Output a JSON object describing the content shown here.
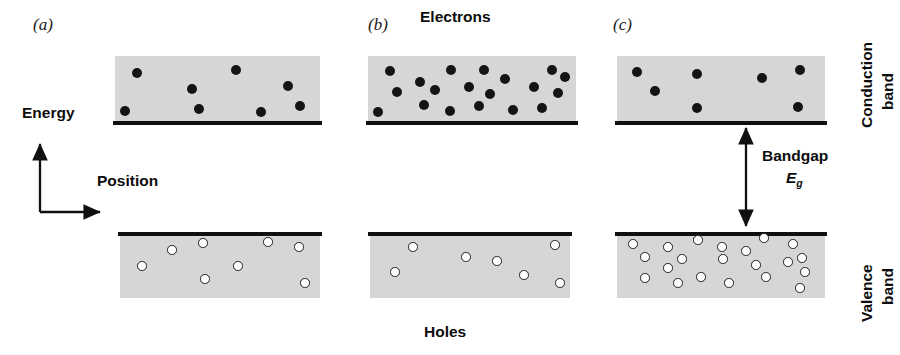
{
  "figure": {
    "background_color": "#ffffff",
    "band_fill_color": "#d6d6d6",
    "band_edge_color": "#101010",
    "electron_color": "#141414",
    "hole_fill_color": "#ffffff",
    "hole_stroke_color": "#1d1d1d"
  },
  "axes": {
    "energy_label": "Energy",
    "position_label": "Position"
  },
  "annotations": {
    "electrons_label": "Electrons",
    "holes_label": "Holes",
    "conduction_band_label_line1": "Conduction",
    "conduction_band_label_line2": "band",
    "valence_band_label_line1": "Valence",
    "valence_band_label_line2": "band",
    "bandgap_label": "Bandgap",
    "bandgap_symbol": "E",
    "bandgap_symbol_subscript": "g"
  },
  "panels": [
    {
      "id": "a",
      "label": "(a)",
      "label_x": 33,
      "label_y": 24,
      "conduction_band": {
        "x": 115,
        "y": 56,
        "width": 205,
        "height": 64,
        "edge_y": 121,
        "edge_height": 4,
        "carrier_type": "electron",
        "carrier_count": 8,
        "carriers": [
          {
            "x": 137,
            "y": 73
          },
          {
            "x": 125,
            "y": 111
          },
          {
            "x": 192,
            "y": 89
          },
          {
            "x": 199,
            "y": 109
          },
          {
            "x": 236,
            "y": 70
          },
          {
            "x": 261,
            "y": 112
          },
          {
            "x": 288,
            "y": 86
          },
          {
            "x": 300,
            "y": 106
          }
        ]
      },
      "valence_band": {
        "x": 120,
        "y": 236,
        "width": 200,
        "height": 62,
        "edge_y": 232,
        "edge_height": 4,
        "carrier_type": "hole",
        "carrier_count": 8,
        "carriers": [
          {
            "x": 142,
            "y": 266
          },
          {
            "x": 172,
            "y": 250
          },
          {
            "x": 203,
            "y": 243
          },
          {
            "x": 205,
            "y": 279
          },
          {
            "x": 238,
            "y": 266
          },
          {
            "x": 268,
            "y": 242
          },
          {
            "x": 299,
            "y": 247
          },
          {
            "x": 305,
            "y": 283
          }
        ]
      }
    },
    {
      "id": "b",
      "label": "(b)",
      "label_x": 368,
      "label_y": 24,
      "conduction_band": {
        "x": 368,
        "y": 56,
        "width": 208,
        "height": 64,
        "edge_y": 121,
        "edge_height": 4,
        "carrier_type": "electron",
        "carrier_count": 19,
        "carriers": [
          {
            "x": 390,
            "y": 71
          },
          {
            "x": 378,
            "y": 112
          },
          {
            "x": 397,
            "y": 92
          },
          {
            "x": 420,
            "y": 82
          },
          {
            "x": 424,
            "y": 105
          },
          {
            "x": 435,
            "y": 90
          },
          {
            "x": 451,
            "y": 70
          },
          {
            "x": 450,
            "y": 111
          },
          {
            "x": 469,
            "y": 87
          },
          {
            "x": 479,
            "y": 106
          },
          {
            "x": 484,
            "y": 70
          },
          {
            "x": 490,
            "y": 94
          },
          {
            "x": 505,
            "y": 79
          },
          {
            "x": 513,
            "y": 110
          },
          {
            "x": 534,
            "y": 87
          },
          {
            "x": 542,
            "y": 108
          },
          {
            "x": 552,
            "y": 70
          },
          {
            "x": 558,
            "y": 93
          },
          {
            "x": 565,
            "y": 77
          }
        ]
      },
      "valence_band": {
        "x": 370,
        "y": 236,
        "width": 200,
        "height": 62,
        "edge_y": 232,
        "edge_height": 4,
        "carrier_type": "hole",
        "carrier_count": 7,
        "carriers": [
          {
            "x": 395,
            "y": 272
          },
          {
            "x": 413,
            "y": 247
          },
          {
            "x": 466,
            "y": 257
          },
          {
            "x": 497,
            "y": 261
          },
          {
            "x": 524,
            "y": 275
          },
          {
            "x": 555,
            "y": 245
          },
          {
            "x": 560,
            "y": 283
          }
        ]
      }
    },
    {
      "id": "c",
      "label": "(c)",
      "label_x": 613,
      "label_y": 24,
      "conduction_band": {
        "x": 617,
        "y": 56,
        "width": 208,
        "height": 64,
        "edge_y": 121,
        "edge_height": 4,
        "carrier_type": "electron",
        "carrier_count": 7,
        "carriers": [
          {
            "x": 637,
            "y": 72
          },
          {
            "x": 655,
            "y": 91
          },
          {
            "x": 697,
            "y": 74
          },
          {
            "x": 697,
            "y": 108
          },
          {
            "x": 762,
            "y": 78
          },
          {
            "x": 800,
            "y": 70
          },
          {
            "x": 798,
            "y": 107
          }
        ]
      },
      "valence_band": {
        "x": 617,
        "y": 236,
        "width": 208,
        "height": 62,
        "edge_y": 232,
        "edge_height": 4,
        "carrier_type": "hole",
        "carrier_count": 21,
        "carriers": [
          {
            "x": 633,
            "y": 244
          },
          {
            "x": 645,
            "y": 278
          },
          {
            "x": 645,
            "y": 257
          },
          {
            "x": 668,
            "y": 247
          },
          {
            "x": 668,
            "y": 268
          },
          {
            "x": 682,
            "y": 259
          },
          {
            "x": 678,
            "y": 283
          },
          {
            "x": 698,
            "y": 240
          },
          {
            "x": 701,
            "y": 277
          },
          {
            "x": 722,
            "y": 247
          },
          {
            "x": 723,
            "y": 259
          },
          {
            "x": 729,
            "y": 283
          },
          {
            "x": 746,
            "y": 251
          },
          {
            "x": 756,
            "y": 265
          },
          {
            "x": 764,
            "y": 238
          },
          {
            "x": 766,
            "y": 277
          },
          {
            "x": 788,
            "y": 262
          },
          {
            "x": 793,
            "y": 244
          },
          {
            "x": 802,
            "y": 258
          },
          {
            "x": 805,
            "y": 272
          },
          {
            "x": 800,
            "y": 288
          }
        ]
      },
      "bandgap_arrow": {
        "x": 746,
        "y_top": 124,
        "y_bottom": 230
      }
    }
  ],
  "labels": {
    "energy": {
      "x": 22,
      "y": 113
    },
    "position": {
      "x": 97,
      "y": 181
    },
    "electrons": {
      "x": 420,
      "y": 14
    },
    "holes": {
      "x": 422,
      "y": 331
    },
    "bandgap": {
      "x": 762,
      "y": 155
    },
    "eg": {
      "x": 786,
      "y": 176
    },
    "conduction_band": {
      "x": 866,
      "y": 28
    },
    "valence_band": {
      "x": 866,
      "y": 232
    }
  },
  "axis_geometry": {
    "origin_x": 40,
    "origin_y": 212,
    "energy_arrow_top_y": 140,
    "position_arrow_right_x": 105
  }
}
